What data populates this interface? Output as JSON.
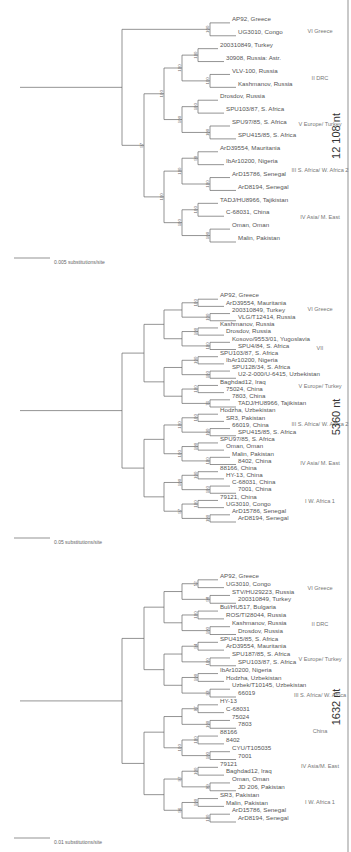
{
  "figure": {
    "panels": [
      {
        "id": "panel-1632",
        "length_label": "1632 nt",
        "scale_label": "0.01 substitutions/site",
        "taxa": [
          "ArD8194, Senegal",
          "ArD15786, Senegal",
          "Malin, Pakistan",
          "SR3, Pakistan",
          "JD 206, Pakistan",
          "Oman, Oman",
          "Baghdad12, Iraq",
          "79121",
          "7001",
          "CYU/T105035",
          "8402",
          "88166",
          "7803",
          "75024",
          "C-68031",
          "HY-13",
          "66019",
          "Uzbek/T10145, Uzbekistan",
          "Hodzha, Uzbekistan",
          "IbAr10200, Nigeria",
          "SPU103/87, S. Africa",
          "SPU187/85, S. Africa",
          "ArD39554, Mauritania",
          "SPU415/85, S. Africa",
          "Drosdov, Russia",
          "Kashmanov, Russia",
          "ROS/TI28044, Russia",
          "Bul/HU517, Bulgaria",
          "200310849, Turkey",
          "STV/HU29223, Russia",
          "UG3010, Congo",
          "AP92, Greece"
        ],
        "groups": [
          "I W. Africa 1",
          "IV Asia/M. East",
          "China",
          "III S. Africa/ W. Africa",
          "V Europe/ Turkey",
          "II DRC",
          "VI Greece"
        ],
        "bootstrap": [
          "100",
          "100",
          "99",
          "100",
          "100",
          "100",
          "100",
          "97",
          "93",
          "100",
          "100",
          "94",
          "100",
          "100",
          "98",
          "52",
          "96",
          "97",
          "100"
        ]
      },
      {
        "id": "panel-5360",
        "length_label": "5360 nt",
        "scale_label": "0.05 substitutions/site",
        "taxa": [
          "ArD8194, Senegal",
          "ArD15786, Senegal",
          "UG3010, Congo",
          "79121, China",
          "7001, China",
          "C-68031, China",
          "HY-13, China",
          "88166, China",
          "8402, China",
          "Malin, Pakistan",
          "Oman, Oman",
          "SPU97/85, S. Africa",
          "SPU415/85, S. Africa",
          "66019, China",
          "SR3, Pakistan",
          "Hodzha, Uzbekistan",
          "TADJ/HU8966, Tajikistan",
          "7803, China",
          "75024, China",
          "Baghdad12, Iraq",
          "U2-2-000/U-6415, Uzbekistan",
          "SPU128/34, S. Africa",
          "IbAr10200, Nigeria",
          "SPU103/87, S. Africa",
          "SPU4/84, S. Africa",
          "Kosovo/9553/01, Yugoslavia",
          "Drosdov, Russia",
          "Kashmanov, Russia",
          "VLG/T12414, Russia",
          "200310849, Turkey",
          "ArD39554, Mauritania",
          "AP92, Greece"
        ],
        "groups": [
          "I W. Africa 1",
          "IV Asia/ M. East",
          "III S. Africa/ W. Africa 2",
          "V Europe/ Turkey",
          "VII",
          "VI Greece"
        ],
        "bootstrap": [
          "100",
          "100",
          "100",
          "100",
          "100",
          "100",
          "100",
          "100",
          "76",
          "100",
          "100",
          "100",
          "100",
          "100",
          "100",
          "100",
          "97",
          "100",
          "100",
          "100"
        ]
      },
      {
        "id": "panel-12108",
        "length_label": "12 108 nt",
        "scale_label": "0.005 substitutions/site",
        "taxa": [
          "Malin, Pakistan",
          "Oman, Oman",
          "C-68031, China",
          "TADJ/HU8966, Tajikistan",
          "ArD8194, Senegal",
          "ArD15786, Senegal",
          "IbAr10200, Nigeria",
          "ArD39554, Mauritania",
          "SPU415/85, S. Africa",
          "SPU97/85, S. Africa",
          "SPU103/87, S. Africa",
          "Drosdov, Russia",
          "Kashmanov, Russia",
          "VLV-100, Russia",
          "30908, Russia: Astr.",
          "200310849, Turkey",
          "UG3010, Congo",
          "AP92, Greece"
        ],
        "groups": [
          "IV Asia/ M. East",
          "III S. Africa/ W. Africa 2",
          "V Europe/ Turkey",
          "II DRC",
          "VI Greece"
        ],
        "bootstrap": [
          "100",
          "100",
          "100",
          "90",
          "100",
          "100",
          "100",
          "100",
          "100",
          "100",
          "100",
          "100",
          "100",
          "100",
          "100",
          "97"
        ]
      }
    ]
  }
}
